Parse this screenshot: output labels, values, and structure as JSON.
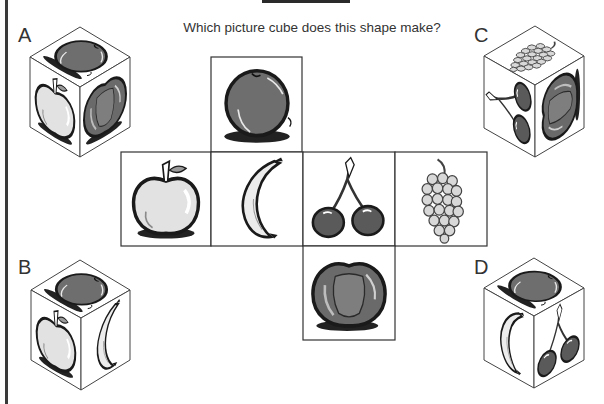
{
  "question": "Which picture cube does this shape make?",
  "options": [
    {
      "label": "A",
      "top": "orange",
      "left": "apple",
      "right": "plum"
    },
    {
      "label": "B",
      "top": "orange",
      "left": "apple",
      "right": "banana"
    },
    {
      "label": "C",
      "top": "grapes",
      "left": "cherries",
      "right": "plum"
    },
    {
      "label": "D",
      "top": "orange",
      "left": "banana",
      "right": "cherries"
    }
  ],
  "net": {
    "top": "orange",
    "middle_row": [
      "apple",
      "banana",
      "cherries",
      "grapes"
    ],
    "bottom": "plum"
  },
  "colors": {
    "line": "#333333",
    "dark_fruit": "#6a6a6a",
    "light_fruit": "#e4e4e4"
  }
}
